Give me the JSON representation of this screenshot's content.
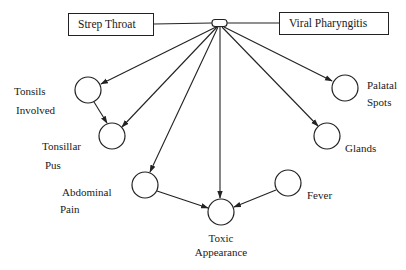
{
  "diagram": {
    "type": "bayesian-network",
    "colors": {
      "stroke": "#222222",
      "background": "#ffffff"
    },
    "root_nodes": [
      {
        "id": "strep",
        "label": "Strep Throat"
      },
      {
        "id": "viral",
        "label": "Viral Pharyngitis"
      }
    ],
    "hub": {
      "id": "hub",
      "shape": "rounded-rect"
    },
    "nodes": [
      {
        "id": "tonsils",
        "label_line1": "Tonsils",
        "label_line2": "Involved",
        "cx": 88,
        "cy": 90
      },
      {
        "id": "tonsillar",
        "label_line1": "Tonsillar",
        "label_line2": "Pus",
        "cx": 112,
        "cy": 136
      },
      {
        "id": "abdominal",
        "label_line1": "Abdominal",
        "label_line2": "Pain",
        "cx": 145,
        "cy": 185
      },
      {
        "id": "toxic",
        "label_line1": "Toxic",
        "label_line2": "Appearance",
        "cx": 221,
        "cy": 212
      },
      {
        "id": "fever",
        "label_line1": "Fever",
        "label_line2": "",
        "cx": 288,
        "cy": 183
      },
      {
        "id": "glands",
        "label_line1": "Glands",
        "label_line2": "",
        "cx": 327,
        "cy": 136
      },
      {
        "id": "palatal",
        "label_line1": "Palatal",
        "label_line2": "Spots",
        "cx": 345,
        "cy": 88
      }
    ],
    "edges": [
      {
        "from": "strep",
        "to": "hub",
        "arrow": false
      },
      {
        "from": "viral",
        "to": "hub",
        "arrow": false
      },
      {
        "from": "hub",
        "to": "tonsils"
      },
      {
        "from": "hub",
        "to": "tonsillar"
      },
      {
        "from": "hub",
        "to": "abdominal"
      },
      {
        "from": "hub",
        "to": "toxic"
      },
      {
        "from": "hub",
        "to": "glands"
      },
      {
        "from": "hub",
        "to": "palatal"
      },
      {
        "from": "tonsils",
        "to": "tonsillar"
      },
      {
        "from": "abdominal",
        "to": "toxic"
      },
      {
        "from": "fever",
        "to": "toxic"
      }
    ]
  }
}
